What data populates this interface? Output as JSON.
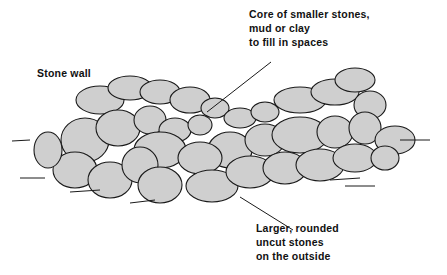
{
  "diagram": {
    "title": "Stone wall",
    "labels": {
      "core": "Core of smaller stones,\nmud or clay\nto fill in spaces",
      "outside": "Larger, rounded\nuncut stones\non the outside",
      "wall": "Stone wall"
    },
    "colors": {
      "stone_fill": "#cfcfcf",
      "outline": "#1a1a1a",
      "background": "#ffffff"
    }
  }
}
